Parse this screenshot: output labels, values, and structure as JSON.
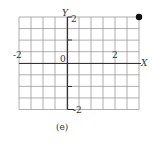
{
  "chart_data": {
    "type": "scatter",
    "title": "",
    "caption": "(e)",
    "xlabel": "X",
    "ylabel": "Y",
    "xlim": [
      -2,
      3
    ],
    "ylim": [
      -2,
      2
    ],
    "grid": true,
    "x_ticks": [
      {
        "value": -2,
        "label": "-2"
      },
      {
        "value": 0,
        "label": "0"
      },
      {
        "value": 2,
        "label": "2"
      }
    ],
    "y_ticks": [
      {
        "value": 2,
        "label": "2"
      },
      {
        "value": -2,
        "label": "-2"
      }
    ],
    "points": [
      {
        "x": 3,
        "y": 2
      }
    ],
    "grid_columns": 10,
    "grid_rows": 8
  },
  "labels": {
    "x_axis": "X",
    "y_axis": "Y",
    "origin": "0",
    "x_neg": "-2",
    "x_pos": "2",
    "y_pos": "2",
    "y_neg": "-2",
    "caption": "(e)"
  },
  "colors": {
    "grid": "#9a9a9a",
    "axis": "#333333",
    "point": "#111111"
  }
}
